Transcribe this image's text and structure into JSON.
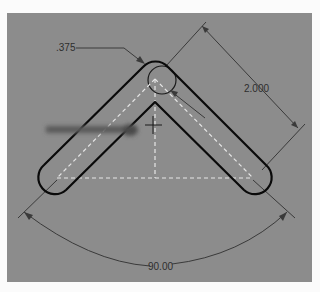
{
  "canvas": {
    "background": "#8c8c8c",
    "outline_color": "#0a0a0a",
    "centerline_color": "#e8e8e8",
    "dimension_color": "#333333"
  },
  "sketch": {
    "shape": "V-shaped slot (two rounded slots meeting at apex)",
    "dimensions": {
      "slot_width": ".375",
      "arm_length": "2.000",
      "angle": "90.00"
    }
  },
  "cursor": {
    "drag_arrow": "drag-arrow",
    "crosshair": "crosshair"
  }
}
